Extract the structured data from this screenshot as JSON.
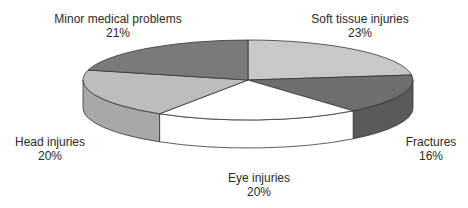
{
  "chart_data": {
    "type": "pie",
    "style": "3d",
    "title": "",
    "categories": [
      "Soft tissue injuries",
      "Fractures",
      "Eye injuries",
      "Head injuries",
      "Minor medical problems"
    ],
    "values": [
      23,
      16,
      20,
      20,
      21
    ],
    "unit": "%",
    "colors": [
      "#c8c8c8",
      "#6e6e6e",
      "#ffffff",
      "#bdbdbd",
      "#7a7a7a"
    ],
    "side_colors": [
      "#c8c8c8",
      "#5a5a5a",
      "#ffffff",
      "#a8a8a8",
      "#6a6a6a"
    ],
    "labels": [
      {
        "name": "Soft tissue injuries",
        "pct": "23%"
      },
      {
        "name": "Fractures",
        "pct": "16%"
      },
      {
        "name": "Eye injuries",
        "pct": "20%"
      },
      {
        "name": "Head injuries",
        "pct": "20%"
      },
      {
        "name": "Minor medical problems",
        "pct": "21%"
      }
    ],
    "legend": "none"
  }
}
